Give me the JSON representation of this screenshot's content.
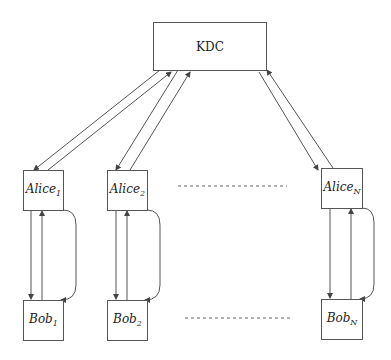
{
  "diagram": {
    "kdc": {
      "label": "KDC"
    },
    "alices": [
      {
        "name": "Alice",
        "sub": "1"
      },
      {
        "name": "Alice",
        "sub": "2"
      },
      {
        "name": "Alice",
        "sub": "N"
      }
    ],
    "bobs": [
      {
        "name": "Bob",
        "sub": "1"
      },
      {
        "name": "Bob",
        "sub": "2"
      },
      {
        "name": "Bob",
        "sub": "N"
      }
    ],
    "colors": {
      "line": "#555555",
      "text": "#222222"
    }
  }
}
